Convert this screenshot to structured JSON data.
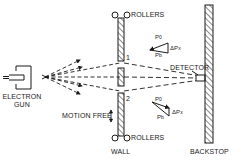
{
  "diagram": {
    "title": "",
    "labels": {
      "electron_gun_line1": "ELECTRON",
      "electron_gun_line2": "GUN",
      "rollers_top": "ROLLERS",
      "rollers_bottom": "ROLLERS",
      "wall": "WALL",
      "backstop": "BACKSTOP",
      "detector": "DETECTOR",
      "motion_free": "MOTION FREE",
      "slit_1": "1",
      "slit_2": "2"
    },
    "vector_diagram_top": {
      "p0": "P",
      "p0_sub": "0",
      "pb": "P",
      "pb_sub": "b",
      "dpx": "ΔP",
      "dpx_sub": "x"
    },
    "vector_diagram_bottom": {
      "p0": "P",
      "p0_sub": "0",
      "pb": "P",
      "pb_sub": "b",
      "dpx": "ΔP",
      "dpx_sub": "x"
    },
    "colors": {
      "ink": "#1a1a1a",
      "background": "#ffffff"
    }
  }
}
